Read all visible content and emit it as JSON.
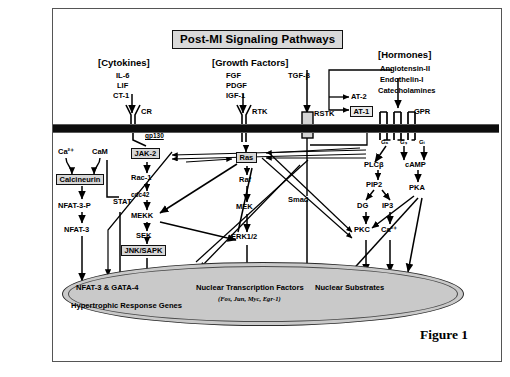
{
  "figure": {
    "title": "Post-MI Signaling Pathways",
    "caption": "Figure 1"
  },
  "ligand_groups": [
    {
      "header": "[Cytokines]",
      "ligands": [
        "IL-6",
        "LIF",
        "CT-1"
      ]
    },
    {
      "header": "[Growth Factors]",
      "ligands": [
        "FGF",
        "PDGF",
        "IGF-1"
      ],
      "extra": [
        "TGF-β"
      ]
    },
    {
      "header": "[Hormones]",
      "ligands": [
        "Angiotensin-II",
        "Endothelin-I",
        "Catecholamines"
      ]
    }
  ],
  "receptors": [
    {
      "name": "CR",
      "note": "gp130"
    },
    {
      "name": "RTK"
    },
    {
      "name": "RSTK"
    },
    {
      "name": "AT-2"
    },
    {
      "name": "AT-1"
    },
    {
      "name": "GPR"
    }
  ],
  "g_subunits": [
    "Gₐ",
    "Gₛ",
    "Gᵢ"
  ],
  "nodes": {
    "calcium": "Ca²⁺",
    "calmodulin": "CaM",
    "calcineurin": "Calcineurin",
    "nfat3p": "NFAT-3-P",
    "nfat3": "NFAT-3",
    "jak2": "JAK-2",
    "stat": "STAT",
    "rac1": "Rac-1",
    "cdc42": "cdc42",
    "mekk": "MEKK",
    "sek": "SEK",
    "jnk_sapk": "JNK/SAPK",
    "ras": "Ras",
    "raf": "Raf",
    "mek": "MEK",
    "erk": "ERK1/2",
    "smad": "Smad",
    "plcb": "PLCβ",
    "pip2": "PIP2",
    "dg": "DG",
    "ip3": "IP3",
    "pkc": "PKC",
    "ca_cyt": "Ca²⁺",
    "camp": "cAMP",
    "pka": "PKA"
  },
  "nucleus": {
    "nfat_gata": "NFAT-3 & GATA-4",
    "hypertrophic": "Hypertrophic Response Genes",
    "transcription_factors": "Nuclear Transcription  Factors",
    "transcription_factors_list": "(Fos, Jun, Myc, Egr-1)",
    "substrates": "Nuclear Substrates"
  },
  "colors": {
    "membrane": "#0d0d0d",
    "nucleus_fill": "#c9c9c9",
    "title_fill": "#d9d9d9",
    "box_fill": "#d7d7d7",
    "frame": "#555555"
  }
}
